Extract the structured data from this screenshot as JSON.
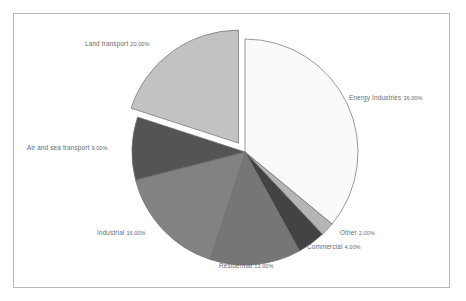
{
  "chart_data": {
    "type": "pie",
    "title": "",
    "subtitle": "",
    "xlabel": "",
    "ylabel": "",
    "legend_position": "none",
    "grid": false,
    "start_angle_deg": 90,
    "direction": "clockwise",
    "value_unit": "%",
    "categories": [
      "Energy Industries",
      "Other",
      "Commercial",
      "Residential",
      "Industrial",
      "Air and sea transport",
      "Land transport"
    ],
    "values": [
      36.0,
      2.0,
      4.0,
      13.0,
      16.0,
      9.0,
      20.0
    ],
    "labels": [
      "Energy Industries 36.00%",
      "Other 2.00%",
      "Commercial 4.00%",
      "Residential 13.00%",
      "Industrial 16.00%",
      "Air and sea transport 9.00%",
      "Land transport 20.00%"
    ],
    "slice_colors": [
      "#fafafa",
      "#b5b5b5",
      "#434343",
      "#767676",
      "#828282",
      "#545454",
      "#c2c2c2"
    ],
    "exploded_slices": [
      "Land transport"
    ],
    "total": 100.0
  },
  "slices": [
    {
      "name": "Energy Industries",
      "label": "Energy Industries",
      "percent": "36.00%",
      "value": 36.0,
      "color": "#fafafa",
      "exploded": false
    },
    {
      "name": "Other",
      "label": "Other",
      "percent": "2.00%",
      "value": 2.0,
      "color": "#b5b5b5",
      "exploded": false
    },
    {
      "name": "Commercial",
      "label": "Commercial",
      "percent": "4.00%",
      "value": 4.0,
      "color": "#434343",
      "exploded": false
    },
    {
      "name": "Residential",
      "label": "Residential",
      "percent": "13.00%",
      "value": 13.0,
      "color": "#767676",
      "exploded": false
    },
    {
      "name": "Industrial",
      "label": "Industrial",
      "percent": "16.00%",
      "value": 16.0,
      "color": "#828282",
      "exploded": false
    },
    {
      "name": "Air and sea transport",
      "label": "Air and sea transport",
      "percent": "9.00%",
      "value": 9.0,
      "color": "#545454",
      "exploded": false
    },
    {
      "name": "Land transport",
      "label": "Land transport",
      "percent": "20.00%",
      "value": 20.0,
      "color": "#c2c2c2",
      "exploded": true
    }
  ],
  "style": {
    "background": "#ffffff",
    "frame_border": "#b9b9b9",
    "label_color": "#6b6b6b",
    "slice_outline": "#6f6f6f"
  }
}
